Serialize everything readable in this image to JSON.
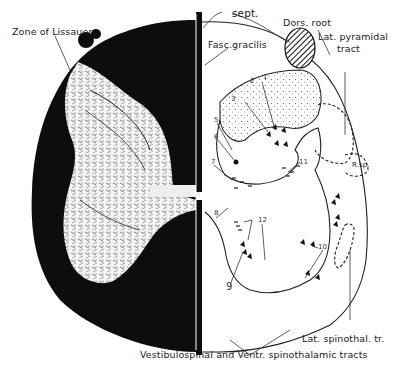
{
  "figure": {
    "labels": {
      "zone_of_lissauer": "Zone of Lissauer",
      "sept": "sept.",
      "fasc_gracilis": "Fasc.gracilis",
      "dors_root": "Dors. root",
      "lat_pyramidal_1": "Lat. pyramidal",
      "lat_pyramidal_2": "tract",
      "r_sp": "R.sp.",
      "lat_spinothal": "Lat. spinothal. tr.",
      "vestibulospinal": "Vestibulospinal and Ventr. spinothalamic tracts"
    },
    "numbers": {
      "n1": "1",
      "n2": "2",
      "n3": "3",
      "n5": "5",
      "n6": "6",
      "n7": "7",
      "n8": "8",
      "n9": "9",
      "n10": "10",
      "n11": "11",
      "n12": "12"
    },
    "colors": {
      "ink": "#111111",
      "paper": "#ffffff",
      "line": "#333333"
    }
  }
}
